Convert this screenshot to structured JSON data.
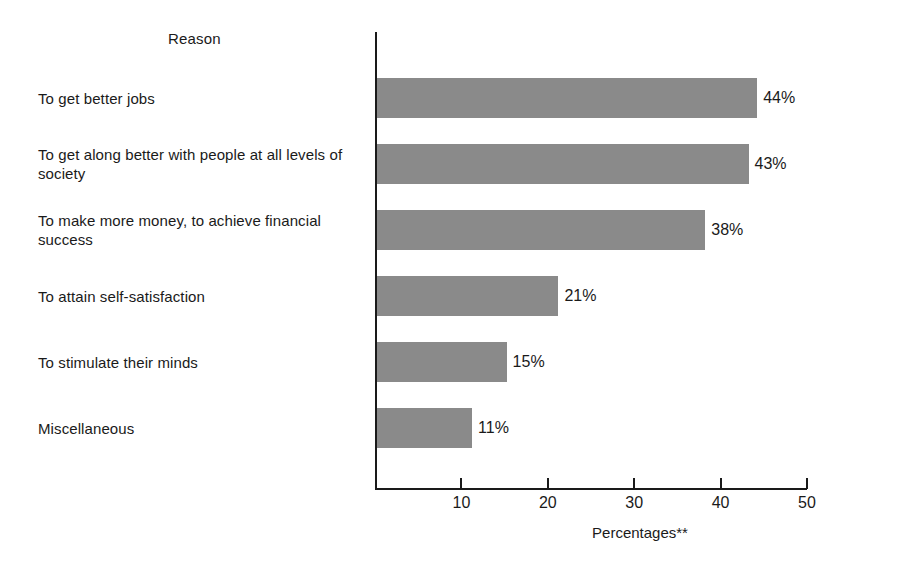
{
  "chart_data": {
    "type": "bar",
    "orientation": "horizontal",
    "title": "",
    "xlabel": "Percentages**",
    "ylabel": "Reason",
    "categories": [
      "To get better jobs",
      "To get along better with people at all levels of society",
      "To make more money, to achieve financial success",
      "To attain self-satisfaction",
      "To stimulate their minds",
      "Miscellaneous"
    ],
    "values": [
      44,
      43,
      38,
      21,
      15,
      11
    ],
    "value_labels": [
      "44%",
      "43%",
      "38%",
      "21%",
      "15%",
      "11%"
    ],
    "xlim": [
      0,
      50
    ],
    "xticks": [
      10,
      20,
      30,
      40,
      50
    ],
    "xtick_labels": [
      "10",
      "20",
      "30",
      "40",
      "50"
    ],
    "grid": false,
    "legend": false,
    "bar_color": "#8a8a8a",
    "axis_color": "#1a1a1a",
    "background": "#ffffff"
  }
}
